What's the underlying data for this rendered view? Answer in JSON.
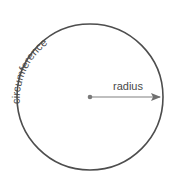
{
  "diagram": {
    "labels": {
      "circumference": "circumference",
      "radius": "radius"
    },
    "circle": {
      "cx": 90,
      "cy": 97,
      "r": 73
    },
    "colors": {
      "circle_stroke": "#4d4d4d",
      "radius_line": "#808080",
      "center_dot": "#7a7a7a",
      "text": "#4a4a4a"
    }
  }
}
